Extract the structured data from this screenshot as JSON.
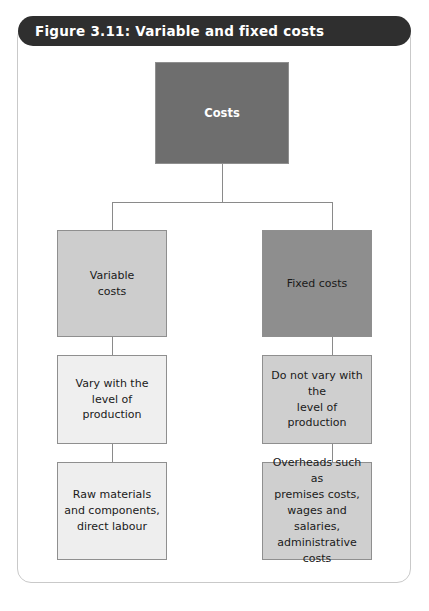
{
  "figure": {
    "title": "Figure 3.11: Variable and fixed costs",
    "title_bar_color": "#2f2f2f",
    "frame_border_color": "#c9c9c9",
    "connector_color": "#8a8a8a"
  },
  "diagram": {
    "type": "tree",
    "root": {
      "id": "costs",
      "label": "Costs",
      "fill": "#6e6e6e",
      "text_color": "#ffffff"
    },
    "branches": [
      {
        "id": "variable-costs",
        "label": "Variable\ncosts",
        "fill": "#cdcdcd",
        "text_color": "#1a1a1a",
        "children": [
          {
            "id": "variable-detail",
            "label": "Vary with the level of\nproduction",
            "fill": "#efefef",
            "text_color": "#1a1a1a"
          },
          {
            "id": "variable-examples",
            "label": "Raw materials\nand components,\ndirect labour",
            "fill": "#eeeeee",
            "text_color": "#1a1a1a"
          }
        ]
      },
      {
        "id": "fixed-costs",
        "label": "Fixed costs",
        "fill": "#8e8e8e",
        "text_color": "#1a1a1a",
        "children": [
          {
            "id": "fixed-detail",
            "label": "Do not vary with the\nlevel of production",
            "fill": "#cfcfcf",
            "text_color": "#1a1a1a"
          },
          {
            "id": "fixed-examples",
            "label": "Overheads such as\npremises costs,\nwages and salaries,\nadministrative costs",
            "fill": "#cfcfcf",
            "text_color": "#1a1a1a"
          }
        ]
      }
    ]
  }
}
